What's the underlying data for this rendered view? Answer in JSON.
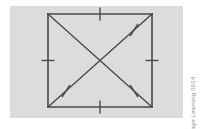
{
  "figure": {
    "name": "square-with-diagonals",
    "panel": {
      "background_color": "#dcdcdc",
      "x": 10,
      "y": 6,
      "width": 173,
      "height": 112
    },
    "page_background_color": "#ffffff",
    "stroke_color": "#4a4a4a",
    "stroke_width": 1.4,
    "square": {
      "left": 48,
      "top": 14,
      "right": 152,
      "bottom": 107,
      "vertices": [
        {
          "label": "top-left",
          "x": 48,
          "y": 14
        },
        {
          "label": "top-right",
          "x": 152,
          "y": 14
        },
        {
          "label": "bottom-right",
          "x": 152,
          "y": 107
        },
        {
          "label": "bottom-left",
          "x": 48,
          "y": 107
        }
      ]
    },
    "center": {
      "x": 100,
      "y": 60.5
    },
    "diagonals": [
      {
        "name": "diagonal-tl-br",
        "x1": 48,
        "y1": 14,
        "x2": 152,
        "y2": 107
      },
      {
        "name": "diagonal-tr-bl",
        "x1": 152,
        "y1": 14,
        "x2": 48,
        "y2": 107
      }
    ],
    "side_tick_marks": [
      {
        "name": "tick-top-side",
        "at_x": 100,
        "at_y": 14,
        "orientation": "vertical",
        "count": 1,
        "length": 13
      },
      {
        "name": "tick-right-side",
        "at_x": 152,
        "at_y": 60.5,
        "orientation": "horizontal",
        "count": 1,
        "length": 13
      },
      {
        "name": "tick-bottom-side",
        "at_x": 100,
        "at_y": 107,
        "orientation": "vertical",
        "count": 1,
        "length": 13
      },
      {
        "name": "tick-left-side",
        "at_x": 48,
        "at_y": 60.5,
        "orientation": "horizontal",
        "count": 1,
        "length": 13
      }
    ],
    "diagonal_tick_marks": [
      {
        "name": "tick-diagonal-upper-left",
        "at_x": 66,
        "at_y": 30,
        "angle_deg": 131,
        "count": 1,
        "length": 12
      },
      {
        "name": "tick-diagonal-upper-right",
        "at_x": 134,
        "at_y": 30,
        "angle_deg": 49,
        "count": 1,
        "length": 12
      },
      {
        "name": "tick-diagonal-lower-left",
        "at_x": 66,
        "at_y": 91,
        "angle_deg": 49,
        "count": 1,
        "length": 12
      },
      {
        "name": "tick-diagonal-lower-right",
        "at_x": 134,
        "at_y": 91,
        "angle_deg": 131,
        "count": 1,
        "length": 12
      }
    ]
  },
  "credit": {
    "text": "© Cengage Learning 2014",
    "color": "#8d8d8d",
    "rotation_deg": -90
  }
}
